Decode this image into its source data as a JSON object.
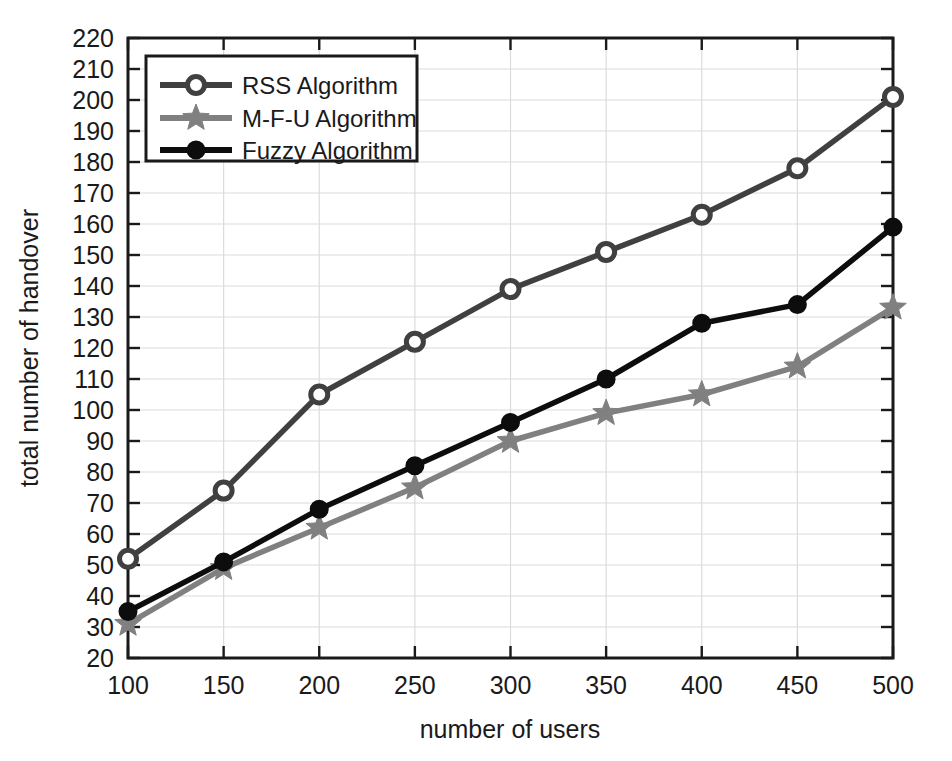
{
  "chart_data": {
    "type": "line",
    "title": "",
    "xlabel": "number of users",
    "ylabel": "total number of handover",
    "x": [
      100,
      150,
      200,
      250,
      300,
      350,
      400,
      450,
      500
    ],
    "xlim": [
      100,
      500
    ],
    "ylim": [
      20,
      220
    ],
    "xticks": [
      "100",
      "150",
      "200",
      "250",
      "300",
      "350",
      "400",
      "450",
      "500"
    ],
    "yticks": [
      "20",
      "30",
      "40",
      "50",
      "60",
      "70",
      "80",
      "90",
      "100",
      "110",
      "120",
      "130",
      "140",
      "150",
      "160",
      "170",
      "180",
      "190",
      "200",
      "210",
      "220"
    ],
    "grid": true,
    "legend_position": "top-left",
    "series": [
      {
        "name": "RSS Algorithm",
        "color": "#404040",
        "marker": "circle-open",
        "values": [
          52,
          74,
          105,
          122,
          139,
          151,
          163,
          178,
          201
        ]
      },
      {
        "name": "M-F-U Algorithm",
        "color": "#808080",
        "marker": "star",
        "values": [
          31,
          49,
          62,
          75,
          90,
          99,
          105,
          114,
          133
        ]
      },
      {
        "name": "Fuzzy Algorithm",
        "color": "#0d0d0d",
        "marker": "circle-filled",
        "values": [
          35,
          51,
          68,
          82,
          96,
          110,
          128,
          134,
          159
        ]
      }
    ]
  },
  "axes": {
    "x_title": "number of users",
    "y_title": "total number of handover"
  },
  "legend": {
    "entries": [
      {
        "label": "RSS Algorithm"
      },
      {
        "label": "M-F-U Algorithm"
      },
      {
        "label": "Fuzzy Algorithm"
      }
    ]
  },
  "colors": {
    "rss": "#404040",
    "mfu": "#808080",
    "fuzzy": "#0d0d0d",
    "grid": "#dcdcdc",
    "axis": "#1a1a1a",
    "background": "#ffffff"
  }
}
